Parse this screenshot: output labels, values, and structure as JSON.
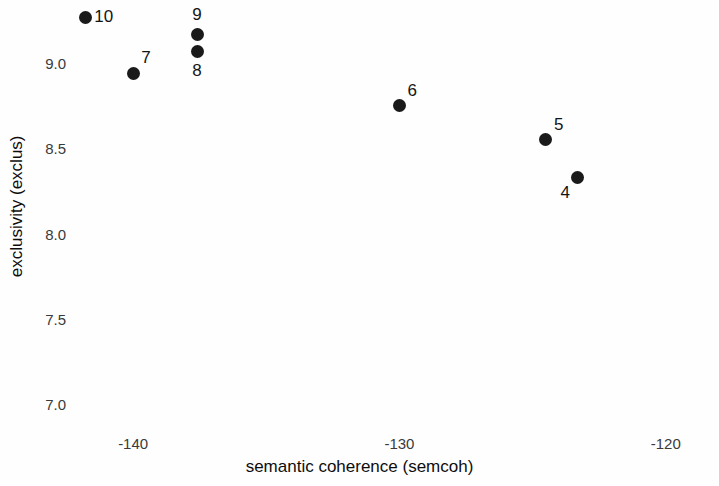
{
  "chart_data": {
    "type": "scatter",
    "title": "",
    "xlabel": "semantic coherence (semcoh)",
    "ylabel": "exclusivity (exclus)",
    "xlim": [
      -145.0,
      -118.0
    ],
    "ylim": [
      6.85,
      9.37
    ],
    "xticks": [
      -140,
      -130,
      -120,
      -110
    ],
    "xticklabels": [
      "-140",
      "-130",
      "-120",
      "-110"
    ],
    "yticks": [
      7.0,
      7.5,
      8.0,
      8.5,
      9.0
    ],
    "yticklabels": [
      "7.0",
      "7.5",
      "8.0",
      "8.5",
      "9.0"
    ],
    "grid": false,
    "legend": null,
    "point_color": "#1a1a1a",
    "point_size": 13,
    "points": [
      {
        "label": "10",
        "x": -141.8,
        "y": 9.27,
        "label_pos": "right"
      },
      {
        "label": "9",
        "x": -137.6,
        "y": 9.17,
        "label_pos": "above"
      },
      {
        "label": "8",
        "x": -137.6,
        "y": 9.07,
        "label_pos": "below"
      },
      {
        "label": "7",
        "x": -140.0,
        "y": 8.94,
        "label_pos": "upper-right"
      },
      {
        "label": "6",
        "x": -130.0,
        "y": 8.75,
        "label_pos": "upper-right"
      },
      {
        "label": "5",
        "x": -124.5,
        "y": 8.55,
        "label_pos": "upper-right"
      },
      {
        "label": "4",
        "x": -123.3,
        "y": 8.33,
        "label_pos": "lower-left"
      },
      {
        "label": "3",
        "x": -114.6,
        "y": 7.84,
        "label_pos": "lower-left"
      },
      {
        "label": "2",
        "x": -104.0,
        "y": 6.95,
        "label_pos": "left"
      }
    ]
  }
}
